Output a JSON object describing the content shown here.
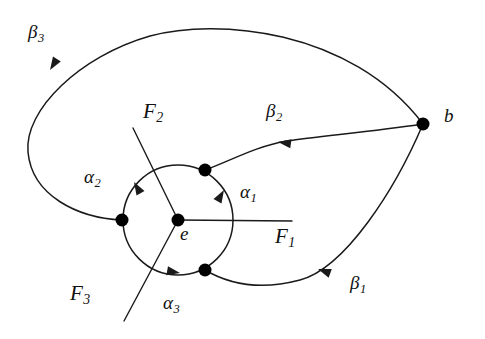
{
  "figure": {
    "type": "mathematical-diagram",
    "background_color": "#ffffff",
    "stroke_color": "#1a1a1a",
    "node_color": "#000000"
  },
  "labels": {
    "beta3": {
      "base": "β",
      "sub": "3",
      "x": 28,
      "y": 22,
      "kind": "greek"
    },
    "beta2": {
      "base": "β",
      "sub": "2",
      "x": 266,
      "y": 101,
      "kind": "greek"
    },
    "beta1": {
      "base": "β",
      "sub": "1",
      "x": 350,
      "y": 273,
      "kind": "greek"
    },
    "alpha1": {
      "base": "α",
      "sub": "1",
      "x": 240,
      "y": 182,
      "kind": "greek"
    },
    "alpha2": {
      "base": "α",
      "sub": "2",
      "x": 84,
      "y": 167,
      "kind": "greek"
    },
    "alpha3": {
      "base": "α",
      "sub": "3",
      "x": 163,
      "y": 293,
      "kind": "greek"
    },
    "F1": {
      "base": "F",
      "sub": "1",
      "x": 275,
      "y": 226,
      "kind": "roman"
    },
    "F2": {
      "base": "F",
      "sub": "2",
      "x": 143,
      "y": 101,
      "kind": "roman"
    },
    "F3": {
      "base": "F",
      "sub": "3",
      "x": 70,
      "y": 283,
      "kind": "roman"
    },
    "e": {
      "base": "e",
      "sub": "",
      "x": 180,
      "y": 224,
      "kind": "point"
    },
    "b": {
      "base": "b",
      "sub": "",
      "x": 444,
      "y": 106,
      "kind": "point"
    }
  },
  "nodes": {
    "e": {
      "x": 178,
      "y": 220,
      "r": 6.5,
      "name": "basepoint-e"
    },
    "b": {
      "x": 423,
      "y": 124,
      "r": 6.5,
      "name": "basepoint-b"
    },
    "v_left": {
      "x": 122,
      "y": 220,
      "r": 6.5,
      "name": "vertex-left"
    },
    "v_upper": {
      "x": 205,
      "y": 170,
      "r": 6.5,
      "name": "vertex-upper-right"
    },
    "v_lower": {
      "x": 205,
      "y": 270,
      "r": 6.5,
      "name": "vertex-lower-right"
    }
  },
  "circle": {
    "cx": 178,
    "cy": 220,
    "r": 55,
    "name": "alpha-loop-circle"
  },
  "rays": {
    "F1": {
      "x1": 178,
      "y1": 220,
      "x2": 292,
      "y2": 221
    },
    "F2": {
      "x1": 178,
      "y1": 220,
      "x2": 133,
      "y2": 128
    },
    "F3": {
      "x1": 178,
      "y1": 220,
      "x2": 124,
      "y2": 321
    }
  },
  "arcs": {
    "beta3": "M 423 124 C 350 28, 215 18, 150 36 C 80 56, 24 110, 28 152 C 32 196, 78 218, 122 220",
    "beta2": "M 423 124 C 370 132, 320 136, 287 141 C 256 146, 228 162, 205 170",
    "beta1": "M 205 270 C 232 286, 262 290, 300 280 C 345 268, 395 190, 423 124"
  },
  "arrowheads": {
    "beta3": {
      "x": 50,
      "y": 70,
      "angle": 122
    },
    "beta2": {
      "x": 278,
      "y": 142,
      "angle": 188
    },
    "beta1": {
      "x": 318,
      "y": 269,
      "angle": 200
    },
    "alpha1": {
      "x": 224,
      "y": 190,
      "angle": 300
    },
    "alpha2": {
      "x": 134,
      "y": 182,
      "angle": 240
    },
    "alpha3": {
      "x": 180,
      "y": 273,
      "angle": 10
    }
  }
}
